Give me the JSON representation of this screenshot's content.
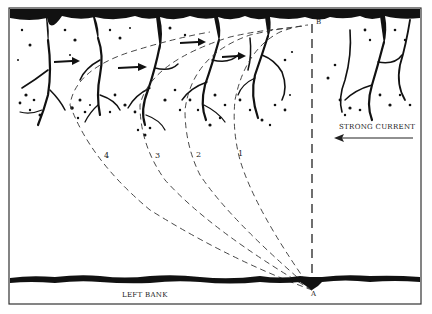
{
  "diagram": {
    "labels": {
      "left_bank": "LEFT BANK",
      "current": "STRONG CURRENT",
      "point_a": "A",
      "point_b": "B",
      "path_1": "1",
      "path_2": "2",
      "path_3": "3",
      "path_4": "4"
    },
    "colors": {
      "ink": "#111111",
      "paper": "#ffffff",
      "frame": "#333333"
    },
    "elements": {
      "far_bank": "far bank with trees and vegetation",
      "near_bank": "left bank shoreline",
      "straight_line": "dashed line from A straight across to B",
      "paths": [
        "path 1",
        "path 2",
        "path 3",
        "path 4"
      ],
      "drift_arrows": 4,
      "current_arrow_direction": "left"
    }
  }
}
